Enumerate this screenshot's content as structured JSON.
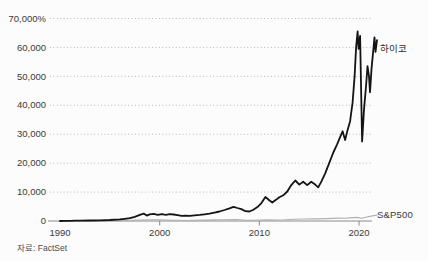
{
  "source_label": "자료: FactSet",
  "colors": {
    "background": "#fcfcfc",
    "grid": "#b8b8b8",
    "axis": "#8a8a8a",
    "text": "#3a3a3a",
    "heico_line": "#141414",
    "sp500_line": "#b0b0b0"
  },
  "chart_data": {
    "type": "line",
    "title": "",
    "xlabel": "",
    "ylabel": "%",
    "grid": "horizontal-dotted",
    "legend_position": "end-of-line-labels",
    "xlim": [
      1990,
      2022
    ],
    "ylim": [
      0,
      70000
    ],
    "yticks": [
      0,
      10000,
      20000,
      30000,
      40000,
      50000,
      60000,
      70000
    ],
    "ytick_labels": [
      "0",
      "10,000",
      "20,000",
      "30,000",
      "40,000",
      "50,000",
      "60,000",
      "70,000%"
    ],
    "xticks": [
      {
        "year": 1990,
        "label": "1990",
        "tick": false
      },
      {
        "year": 2000,
        "label": "2000",
        "tick": true
      },
      {
        "year": 2010,
        "label": "2010",
        "tick": true
      },
      {
        "year": 2020,
        "label": "2020",
        "tick": true
      }
    ],
    "series": [
      {
        "key": "sp500",
        "name": "S&P500",
        "color": "#b0b0b0",
        "width": 1.1,
        "x": [
          1990,
          1991,
          1992,
          1993,
          1994,
          1995,
          1996,
          1997,
          1998,
          1999,
          2000,
          2000.7,
          2001.5,
          2002.7,
          2003.5,
          2004.5,
          2005.5,
          2006.5,
          2007.7,
          2008.5,
          2009.2,
          2010,
          2011,
          2011.7,
          2012.5,
          2013.5,
          2014.5,
          2015.5,
          2016,
          2016.8,
          2017.8,
          2018.7,
          2019,
          2019.8,
          2020.25,
          2020.7,
          2021.2,
          2021.8
        ],
        "y": [
          0,
          25,
          35,
          50,
          50,
          105,
          155,
          240,
          340,
          440,
          430,
          360,
          280,
          170,
          260,
          320,
          370,
          440,
          520,
          320,
          210,
          330,
          380,
          340,
          430,
          590,
          690,
          710,
          740,
          830,
          1010,
          930,
          1060,
          1260,
          940,
          1300,
          1700,
          2050
        ]
      },
      {
        "key": "heico",
        "name": "하이코",
        "color": "#141414",
        "width": 1.8,
        "x": [
          1990,
          1990.5,
          1991,
          1991.5,
          1992,
          1993,
          1994,
          1995,
          1996,
          1996.5,
          1997,
          1997.5,
          1998,
          1998.4,
          1998.7,
          1999,
          1999.4,
          1999.8,
          2000.2,
          2000.6,
          2001,
          2001.4,
          2001.8,
          2002.2,
          2002.6,
          2003,
          2003.5,
          2004,
          2004.5,
          2005,
          2005.5,
          2006,
          2006.5,
          2007,
          2007.4,
          2007.8,
          2008.2,
          2008.6,
          2009,
          2009.4,
          2009.8,
          2010.2,
          2010.6,
          2011,
          2011.3,
          2011.7,
          2012,
          2012.4,
          2012.8,
          2013.2,
          2013.6,
          2014,
          2014.4,
          2014.8,
          2015.2,
          2015.6,
          2015.9,
          2016.2,
          2016.6,
          2017,
          2017.4,
          2017.8,
          2018.1,
          2018.35,
          2018.6,
          2018.85,
          2019.1,
          2019.35,
          2019.55,
          2019.7,
          2019.85,
          2019.95,
          2020.1,
          2020.3,
          2020.5,
          2020.7,
          2020.85,
          2021,
          2021.1,
          2021.25,
          2021.4,
          2021.55,
          2021.65,
          2021.8
        ],
        "y": [
          0,
          20,
          60,
          90,
          130,
          180,
          240,
          360,
          560,
          750,
          1000,
          1450,
          2100,
          2550,
          1850,
          2300,
          2500,
          2150,
          2350,
          2150,
          2400,
          2250,
          2050,
          1750,
          1850,
          1800,
          1950,
          2100,
          2300,
          2550,
          2900,
          3300,
          3800,
          4400,
          4900,
          4500,
          4100,
          3400,
          3300,
          3900,
          4800,
          6200,
          8300,
          7200,
          6400,
          7400,
          8200,
          8900,
          10200,
          12400,
          14000,
          12600,
          13600,
          12400,
          13600,
          12600,
          11600,
          13500,
          16500,
          20000,
          23500,
          26500,
          29000,
          31000,
          28000,
          31500,
          34500,
          41000,
          50000,
          60000,
          65500,
          59500,
          64000,
          27500,
          38500,
          46500,
          53500,
          50000,
          44500,
          52500,
          58000,
          63500,
          58500,
          62500
        ]
      }
    ]
  }
}
